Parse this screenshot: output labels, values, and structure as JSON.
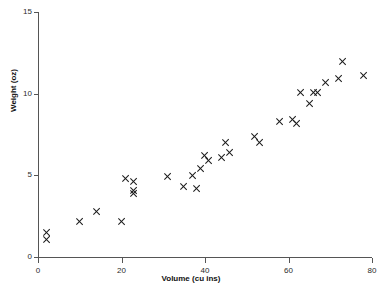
{
  "chart_data": {
    "type": "scatter",
    "title": "",
    "xlabel": "Volume (cu ins)",
    "ylabel": "Weight (oz)",
    "xlim": [
      0,
      80
    ],
    "ylim": [
      0,
      15
    ],
    "xticks": [
      0,
      20,
      40,
      60,
      80
    ],
    "yticks": [
      0,
      5,
      10,
      15
    ],
    "grid": false,
    "legend": null,
    "marker": "x",
    "marker_color": "#1a1a1a",
    "points": [
      {
        "x": 2,
        "y": 1.5
      },
      {
        "x": 2,
        "y": 1.1
      },
      {
        "x": 10,
        "y": 2.2
      },
      {
        "x": 14,
        "y": 2.8
      },
      {
        "x": 20,
        "y": 2.2
      },
      {
        "x": 21,
        "y": 4.8
      },
      {
        "x": 23,
        "y": 4.6
      },
      {
        "x": 23,
        "y": 4.1
      },
      {
        "x": 23,
        "y": 3.9
      },
      {
        "x": 31,
        "y": 4.9
      },
      {
        "x": 35,
        "y": 4.3
      },
      {
        "x": 37,
        "y": 5.0
      },
      {
        "x": 38,
        "y": 4.2
      },
      {
        "x": 39,
        "y": 5.4
      },
      {
        "x": 40,
        "y": 6.2
      },
      {
        "x": 41,
        "y": 5.9
      },
      {
        "x": 44,
        "y": 6.1
      },
      {
        "x": 45,
        "y": 7.0
      },
      {
        "x": 46,
        "y": 6.4
      },
      {
        "x": 52,
        "y": 7.4
      },
      {
        "x": 53,
        "y": 7.0
      },
      {
        "x": 58,
        "y": 8.3
      },
      {
        "x": 61,
        "y": 8.4
      },
      {
        "x": 62,
        "y": 8.2
      },
      {
        "x": 63,
        "y": 10.1
      },
      {
        "x": 65,
        "y": 9.4
      },
      {
        "x": 66,
        "y": 10.1
      },
      {
        "x": 67,
        "y": 10.1
      },
      {
        "x": 69,
        "y": 10.7
      },
      {
        "x": 73,
        "y": 12.0
      },
      {
        "x": 72,
        "y": 10.9
      },
      {
        "x": 78,
        "y": 11.1
      }
    ]
  }
}
